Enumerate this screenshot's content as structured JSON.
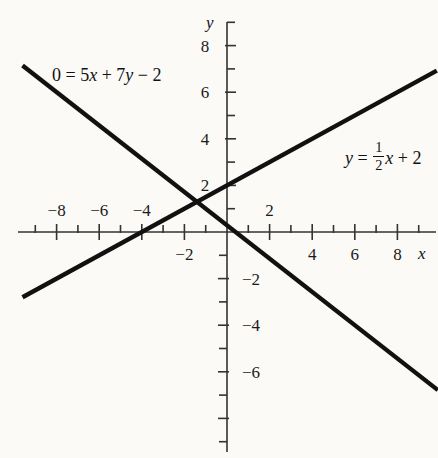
{
  "figure": {
    "background_color": "#fbfaf7",
    "line_color": "#111111",
    "axis_color": "#333333"
  },
  "axes": {
    "x_axis_name": "x",
    "y_axis_name": "y",
    "x_labels": [
      {
        "value": -8,
        "text": "−8",
        "side": "above"
      },
      {
        "value": -6,
        "text": "−6",
        "side": "above"
      },
      {
        "value": -4,
        "text": "−4",
        "side": "above"
      },
      {
        "value": -2,
        "text": "−2",
        "side": "below"
      },
      {
        "value": 2,
        "text": "2",
        "side": "above"
      },
      {
        "value": 4,
        "text": "4",
        "side": "below"
      },
      {
        "value": 6,
        "text": "6",
        "side": "below"
      },
      {
        "value": 8,
        "text": "8",
        "side": "below"
      }
    ],
    "y_labels": [
      {
        "value": 8,
        "text": "8",
        "side": "left"
      },
      {
        "value": 6,
        "text": "6",
        "side": "left"
      },
      {
        "value": 4,
        "text": "4",
        "side": "left"
      },
      {
        "value": 2,
        "text": "2",
        "side": "left"
      },
      {
        "value": -2,
        "text": "−2",
        "side": "right"
      },
      {
        "value": -4,
        "text": "−4",
        "side": "right"
      },
      {
        "value": -6,
        "text": "−6",
        "side": "right"
      }
    ]
  },
  "annotations": {
    "line1_label": "0 = 5x + 7y − 2",
    "line1_parts": {
      "lhs": "0 =",
      "coef1": "5",
      "var1": "x",
      "plus": "+",
      "coef2": "7",
      "var2": "y",
      "minus": "− 2"
    },
    "line2_label": "y = 1/2 x + 2",
    "line2_parts": {
      "var": "y",
      "equals": "=",
      "numerator": "1",
      "denominator": "2",
      "xterm": "x",
      "constant": "+ 2"
    }
  },
  "chart_data": {
    "type": "line",
    "title": "",
    "xlabel": "x",
    "ylabel": "y",
    "xlim": [
      -9.8,
      9.9
    ],
    "ylim": [
      -9.5,
      9.1
    ],
    "grid": false,
    "legend": "inline-annotations",
    "x_ticks_major": [
      -8,
      -6,
      -4,
      -2,
      2,
      4,
      6,
      8
    ],
    "x_ticks_minor": [
      -9,
      -7,
      -5,
      -3,
      -1,
      1,
      3,
      5,
      7,
      9
    ],
    "y_ticks_major": [
      -8,
      -6,
      -4,
      -2,
      2,
      4,
      6,
      8
    ],
    "y_ticks_minor": [
      -9,
      -7,
      -5,
      -3,
      -1,
      1,
      3,
      5,
      7,
      9
    ],
    "intersection": [
      -1.45,
      1.27
    ],
    "series": [
      {
        "name": "0 = 5x + 7y − 2",
        "equation": "0 = 5x + 7y - 2",
        "slope": -0.7142857,
        "intercept": 0.2857143,
        "x_range": [
          -9.6,
          9.9
        ],
        "points": [
          [
            -9.6,
            7.14
          ],
          [
            9.9,
            -6.79
          ]
        ]
      },
      {
        "name": "y = (1/2)x + 2",
        "equation": "y = 0.5x + 2",
        "slope": 0.5,
        "intercept": 2,
        "x_range": [
          -9.6,
          9.85
        ],
        "points": [
          [
            -9.6,
            -2.8
          ],
          [
            9.85,
            6.93
          ]
        ]
      }
    ]
  }
}
